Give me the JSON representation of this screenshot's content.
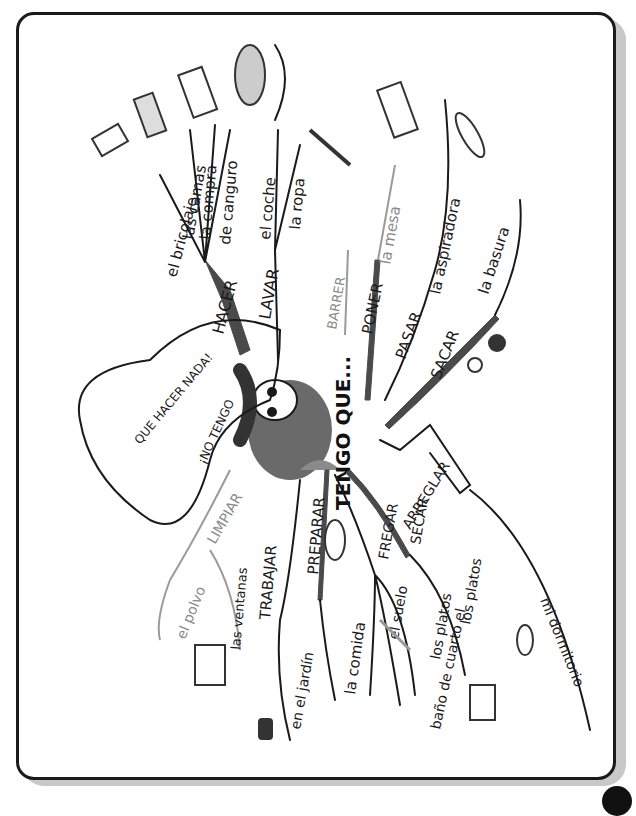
{
  "title": "TENGO QUE...",
  "orientation": "rotated 90° clockwise",
  "speech_bubble": "¡NO TENGO QUE HACER NADA!",
  "branches": [
    {
      "verb": "HACER",
      "objects": [
        "el bricolaje",
        "las camas",
        "la compra",
        "de canguro"
      ]
    },
    {
      "verb": "LAVAR",
      "objects": [
        "el coche",
        "la ropa"
      ]
    },
    {
      "verb": "BARRER",
      "objects": []
    },
    {
      "verb": "PONER",
      "objects": [
        "la mesa"
      ]
    },
    {
      "verb": "PASAR",
      "objects": [
        "la aspiradora"
      ]
    },
    {
      "verb": "SACAR",
      "objects": [
        "la basura"
      ]
    },
    {
      "verb": "ARREGLAR",
      "objects": [
        "mi dormitorio"
      ]
    },
    {
      "verb": "SECAR",
      "objects": [
        "los platos"
      ]
    },
    {
      "verb": "FREGAR",
      "objects": [
        "los platos",
        "el suelo",
        "el cuarto de baño"
      ]
    },
    {
      "verb": "PREPARAR",
      "objects": [
        "la comida"
      ]
    },
    {
      "verb": "TRABAJAR",
      "objects": [
        "en el jardín"
      ]
    },
    {
      "verb": "LIMPIAR",
      "objects": [
        "el polvo",
        "las ventanas"
      ]
    }
  ],
  "labels": {
    "center": "TENGO QUE...",
    "hacer": "HACER",
    "bricolaje": "el bricolaje",
    "camas": "las camas",
    "compra": "la compra",
    "canguro": "de canguro",
    "lavar": "LAVAR",
    "coche": "el coche",
    "ropa": "la ropa",
    "barrer": "BARRER",
    "poner": "PONER",
    "mesa": "la mesa",
    "pasar": "PASAR",
    "aspiradora": "la aspiradora",
    "sacar": "SACAR",
    "basura": "la basura",
    "arreglar": "ARREGLAR",
    "dormitorio": "mi dormitorio",
    "secar": "SECAR",
    "platos1": "los platos",
    "fregar": "FREGAR",
    "platos2": "los platos",
    "suelo": "el suelo",
    "bano": "baño de cuarto el",
    "preparar": "PREPARAR",
    "comida": "la comida",
    "trabajar": "TRABAJAR",
    "jardin": "en el jardín",
    "limpiar": "LIMPIAR",
    "polvo": "el polvo",
    "ventanas": "las ventanas",
    "bubble_line1": "¡NO TENGO",
    "bubble_line2": "QUE HACER NADA!"
  },
  "colors": {
    "ink": "#1a1a1a",
    "gray_ink": "#8a8a8a",
    "frame": "#1a1a1a",
    "shadow": "#c8c8c8"
  }
}
